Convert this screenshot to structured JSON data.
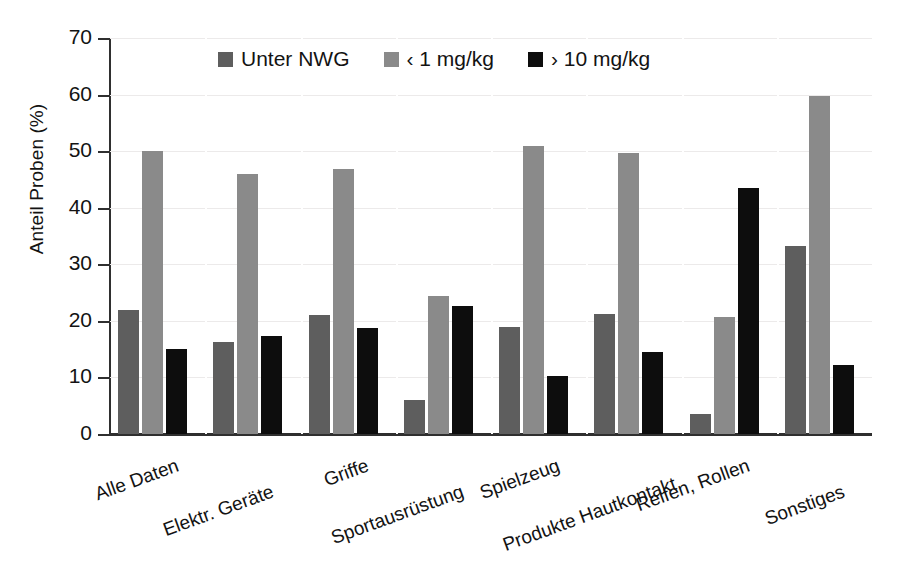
{
  "chart_data": {
    "type": "bar",
    "title": "",
    "xlabel": "",
    "ylabel": "Anteil Proben (%)",
    "ylim": [
      0,
      70
    ],
    "ytick_values": [
      70,
      60,
      50,
      40,
      30,
      20,
      10,
      0
    ],
    "ytick_labels": [
      "70",
      "60",
      "50",
      "40",
      "30",
      "20",
      "10",
      "0"
    ],
    "grid": true,
    "legend_position": "top-center",
    "categories": [
      "Alle Daten",
      "Elektr. Geräte",
      "Griffe",
      "Sportausrüstung",
      "Spielzeug",
      "Produkte Hautkontakt",
      "Reifen, Rollen",
      "Sonstiges"
    ],
    "series": [
      {
        "name": "Unter NWG",
        "color": "#5e5e5e",
        "values": [
          22.0,
          16.3,
          21.0,
          6.1,
          19.0,
          21.3,
          3.5,
          33.3
        ]
      },
      {
        "name": "‹ 1 mg/kg",
        "color": "#8a8a8a",
        "values": [
          50.0,
          46.0,
          46.8,
          24.4,
          51.0,
          49.7,
          20.7,
          59.8
        ]
      },
      {
        "name": "› 10 mg/kg",
        "color": "#0d0d0d",
        "values": [
          15.0,
          17.3,
          18.7,
          22.7,
          10.3,
          14.5,
          43.5,
          12.2
        ]
      }
    ]
  },
  "colors": {
    "series_unter_nwg": "#5e5e5e",
    "series_lt_1": "#8a8a8a",
    "series_gt_10": "#0d0d0d",
    "axis": "#2f2f2f",
    "gridline": "#eceaea",
    "background": "#ffffff",
    "text": "#131313"
  }
}
